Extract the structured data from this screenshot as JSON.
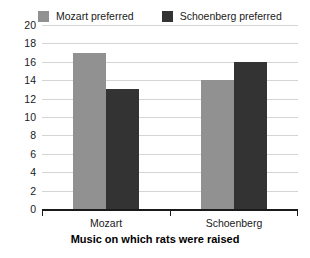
{
  "chart_data": {
    "type": "bar",
    "title": "",
    "subtitle": "",
    "xlabel": "Music on which rats were raised",
    "ylabel": "",
    "categories": [
      "Mozart",
      "Schoenberg"
    ],
    "series": [
      {
        "name": "Mozart preferred",
        "color": "#919191",
        "values": [
          17,
          14
        ]
      },
      {
        "name": "Schoenberg preferred",
        "color": "#333333",
        "values": [
          13,
          16
        ]
      }
    ],
    "ylim": [
      0,
      20
    ],
    "ytick_step": 2,
    "yticks": [
      0,
      2,
      4,
      6,
      8,
      10,
      12,
      14,
      16,
      18,
      20
    ],
    "ytick_labels": [
      "0",
      "2",
      "4",
      "6",
      "8",
      "10",
      "12",
      "14",
      "16",
      "18",
      "20"
    ],
    "grid": true,
    "grid_axis": "y",
    "grid_color": "#d4d4d4",
    "legend_position": "top",
    "axis_color": "#1a1a1a",
    "background": "#ffffff"
  },
  "legend": {
    "entries": [
      {
        "label": "Mozart preferred",
        "swatch": "#919191"
      },
      {
        "label": "Schoenberg preferred",
        "swatch": "#333333"
      }
    ]
  },
  "axis": {
    "x_title": "Music on which rats were raised",
    "categories": [
      "Mozart",
      "Schoenberg"
    ]
  }
}
